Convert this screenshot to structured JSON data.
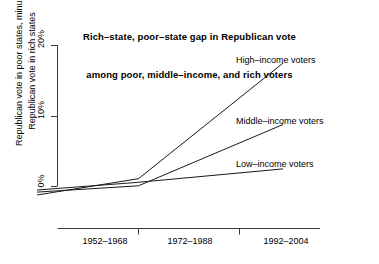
{
  "chart_data": {
    "type": "line",
    "title_line1": "Rich–state, poor–state gap in Republican vote",
    "title_line2": "among poor, middle–income, and rich voters",
    "xlabel": "",
    "ylabel": "Republican vote in poor states, minus\nRepublican vote in rich states",
    "ylabel_line1": "Republican vote in poor states, minus",
    "ylabel_line2": "Republican vote in rich states",
    "categories": [
      "1952–1968",
      "1972–1988",
      "1992–2004"
    ],
    "yticks": [
      "0%",
      "10%",
      "20%"
    ],
    "ytick_values": [
      0,
      10,
      20
    ],
    "ylim": [
      -1.5,
      21
    ],
    "grid": false,
    "legend_position": "inline-right",
    "line_color": "#1a1a1a",
    "background": "#ffffff",
    "series": [
      {
        "name": "High–income voters",
        "label": "High–income voters",
        "values": [
          -1.2,
          1.1,
          17.5
        ]
      },
      {
        "name": "Middle–income voters",
        "label": "Middle–income voters",
        "values": [
          -0.8,
          0.1,
          8.8
        ]
      },
      {
        "name": "Low–income voters",
        "label": "Low–income voters",
        "values": [
          -0.5,
          0.6,
          2.5
        ]
      }
    ]
  },
  "axis": {
    "ytick_0": "0%",
    "ytick_10": "10%",
    "ytick_20": "20%",
    "xtick_1": "1952–1968",
    "xtick_2": "1972–1988",
    "xtick_3": "1992–2004"
  },
  "labels": {
    "high": "High–income voters",
    "middle": "Middle–income voters",
    "low": "Low–income voters"
  }
}
